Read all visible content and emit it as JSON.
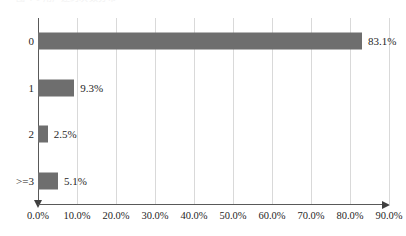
{
  "title_fragment": "图 4-1 用户违约次数分布",
  "chart_data": {
    "type": "bar",
    "orientation": "horizontal",
    "title": "",
    "xlabel": "",
    "ylabel": "",
    "categories": [
      "0",
      "1",
      "2",
      ">=3"
    ],
    "values": [
      83.1,
      9.3,
      2.5,
      5.1
    ],
    "value_labels": [
      "83.1%",
      "9.3%",
      "2.5%",
      "5.1%"
    ],
    "xlim": [
      0,
      90
    ],
    "x_ticks": [
      0,
      10,
      20,
      30,
      40,
      50,
      60,
      70,
      80,
      90
    ],
    "x_tick_labels": [
      "0.0%",
      "10.0%",
      "20.0%",
      "30.0%",
      "40.0%",
      "50.0%",
      "60.0%",
      "70.0%",
      "80.0%",
      "90.0%"
    ],
    "grid": "vertical",
    "legend": null,
    "bar_color": "#6e6e6e",
    "gridline_color": "#d9d9d9",
    "axis_color": "#595959",
    "text_color": "#262626"
  }
}
